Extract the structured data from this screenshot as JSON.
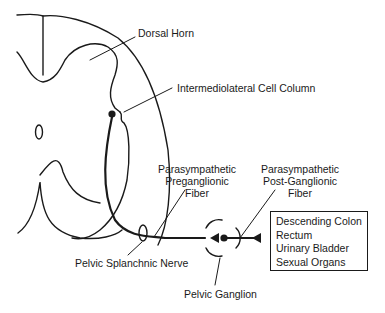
{
  "diagram": {
    "labels": {
      "dorsal_horn": "Dorsal Horn",
      "iml": "Intermediolateral Cell Column",
      "pre_line1": "Parasympathetic",
      "pre_line2": "Preganglionic",
      "pre_line3": "Fiber",
      "post_line1": "Parasympathetic",
      "post_line2": "Post-Ganglionic",
      "post_line3": "Fiber",
      "splanchnic": "Pelvic Splanchnic Nerve",
      "ganglion": "Pelvic Ganglion"
    },
    "targets": [
      "Descending Colon",
      "Rectum",
      "Urinary Bladder",
      "Sexual Organs"
    ],
    "colors": {
      "line": "#1a1a1a",
      "background": "#ffffff"
    }
  }
}
